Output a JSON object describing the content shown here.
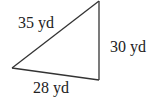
{
  "figure": {
    "type": "triangle",
    "stroke_color": "#333333",
    "vertices": {
      "top": [
        99,
        1
      ],
      "left": [
        12,
        68
      ],
      "bottom_right": [
        99,
        80
      ]
    },
    "sides": [
      {
        "id": "hypotenuse",
        "from": "left",
        "to": "top",
        "label": "35 yd"
      },
      {
        "id": "right",
        "from": "top",
        "to": "bottom_right",
        "label": "30 yd"
      },
      {
        "id": "bottom",
        "from": "left",
        "to": "bottom_right",
        "label": "28 yd"
      }
    ]
  },
  "labels": {
    "left_side": "35 yd",
    "right_side": "30 yd",
    "bottom_side": "28 yd"
  }
}
